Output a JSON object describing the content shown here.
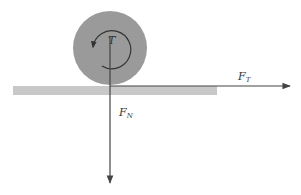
{
  "diagram": {
    "type": "free-body force diagram",
    "object": {
      "shape": "circle",
      "color": "#9a9a9a",
      "label": "T"
    },
    "surface": {
      "color": "#c8c8c8"
    },
    "arrow_color": "#444444",
    "forces": [
      {
        "name": "F_T",
        "label_main": "F",
        "label_sub": "T",
        "direction": "right"
      },
      {
        "name": "F_N",
        "label_main": "F",
        "label_sub": "N",
        "direction": "down"
      }
    ],
    "torque": {
      "label": "T",
      "direction": "counterclockwise"
    }
  }
}
